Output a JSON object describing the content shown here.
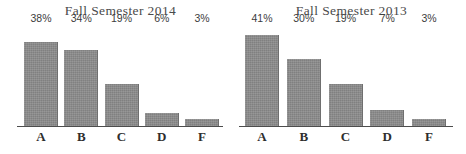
{
  "chart_data": [
    {
      "type": "bar",
      "title": "Fall Semester 2014",
      "xlabel": "",
      "ylabel": "",
      "categories": [
        "A",
        "B",
        "C",
        "D",
        "F"
      ],
      "values": [
        38,
        34,
        19,
        6,
        3
      ],
      "value_labels": [
        "38%",
        "34%",
        "19%",
        "6%",
        "3%"
      ],
      "ylim": [
        0,
        45
      ],
      "grid": false,
      "legend": "none",
      "bar_color": "#8b8b8b",
      "axis_color": "#4d4d4d",
      "background": "#ffffff"
    },
    {
      "type": "bar",
      "title": "Fall Semester 2013",
      "xlabel": "",
      "ylabel": "",
      "categories": [
        "A",
        "B",
        "C",
        "D",
        "F"
      ],
      "values": [
        41,
        30,
        19,
        7,
        3
      ],
      "value_labels": [
        "41%",
        "30%",
        "19%",
        "7%",
        "3%"
      ],
      "ylim": [
        0,
        45
      ],
      "grid": false,
      "legend": "none",
      "bar_color": "#8b8b8b",
      "axis_color": "#4d4d4d",
      "background": "#ffffff"
    }
  ]
}
